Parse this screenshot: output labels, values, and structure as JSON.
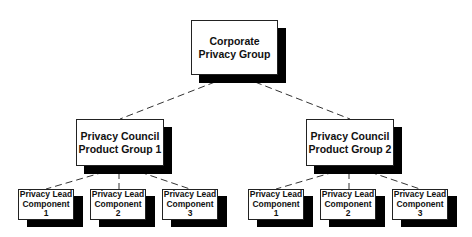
{
  "diagram": {
    "type": "org-chart",
    "root": {
      "label_line1": "Corporate",
      "label_line2": "Privacy Group"
    },
    "groups": [
      {
        "label_line1": "Privacy Council",
        "label_line2": "Product Group 1",
        "children": [
          {
            "line1": "Privacy Lead",
            "line2": "Component",
            "line3": "1"
          },
          {
            "line1": "Privacy Lead",
            "line2": "Component",
            "line3": "2"
          },
          {
            "line1": "Privacy Lead",
            "line2": "Component",
            "line3": "3"
          }
        ]
      },
      {
        "label_line1": "Privacy Council",
        "label_line2": "Product Group 2",
        "children": [
          {
            "line1": "Privacy Lead",
            "line2": "Component",
            "line3": "1"
          },
          {
            "line1": "Privacy Lead",
            "line2": "Component",
            "line3": "2"
          },
          {
            "line1": "Privacy Lead",
            "line2": "Component",
            "line3": "3"
          }
        ]
      }
    ],
    "connector_style": "dashed"
  }
}
